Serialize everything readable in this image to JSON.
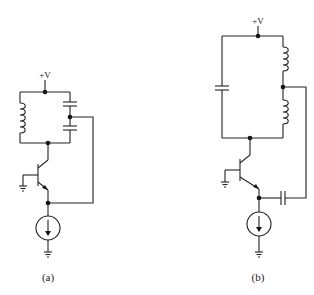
{
  "figure": {
    "circuits": [
      {
        "id": "a",
        "caption": "(a)",
        "supply_label": "+V",
        "tank": "Colpitts: inductor on left branch, two series capacitors on right branch with center tap feedback",
        "components": [
          "inductor",
          "capacitor",
          "capacitor",
          "npn-transistor",
          "current-source",
          "ground",
          "ground"
        ]
      },
      {
        "id": "b",
        "caption": "(b)",
        "supply_label": "+V",
        "tank": "Hartley: capacitor on left branch, two series inductors on right branch with center tap feedback via coupling capacitor",
        "components": [
          "capacitor",
          "inductor",
          "inductor",
          "npn-transistor",
          "coupling-capacitor",
          "current-source",
          "ground",
          "ground"
        ]
      }
    ]
  }
}
